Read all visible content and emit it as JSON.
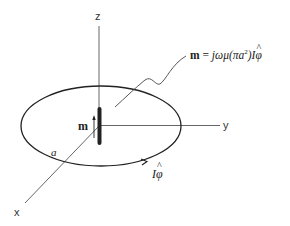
{
  "figure": {
    "type": "magnetic dipole loop diagram",
    "axes": {
      "z_label": "z",
      "y_label": "y",
      "x_label": "x"
    },
    "loop": {
      "radius_label": "a",
      "current_label_I": "I",
      "current_label_phi": "φ",
      "current_hat": "^"
    },
    "dipole": {
      "moment_label": "m"
    },
    "formula": {
      "lhs": "m",
      "equals": " = ",
      "rhs_prefix": "jωμ(πa",
      "rhs_exponent": "2",
      "rhs_suffix": ")I",
      "rhs_phi": "φ",
      "rhs_hat": "^"
    },
    "colors": {
      "stroke": "#222222",
      "axis": "#555555",
      "background": "#ffffff"
    }
  }
}
